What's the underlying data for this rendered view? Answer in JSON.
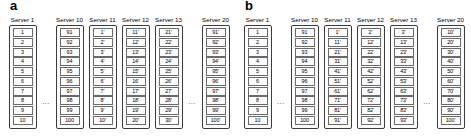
{
  "figure": {
    "panels": [
      {
        "label": "a",
        "columns": [
          {
            "title": "Server 1",
            "cells": [
              "1",
              "2",
              "3",
              "4",
              "5",
              "6",
              "7",
              "8",
              "9",
              "10"
            ]
          },
          {
            "ellipsis": "..."
          },
          {
            "title": "Server 10",
            "cells": [
              "91",
              "92",
              "93",
              "94",
              "95",
              "96",
              "97",
              "98",
              "99",
              "100"
            ]
          },
          {
            "title": "Server 11",
            "cells": [
              "1'",
              "2'",
              "3'",
              "4'",
              "5'",
              "6'",
              "7'",
              "8'",
              "9'",
              "10'"
            ]
          },
          {
            "title": "Server 12",
            "cells": [
              "11'",
              "12'",
              "13'",
              "14'",
              "15'",
              "16'",
              "17'",
              "18'",
              "19'",
              "20'"
            ]
          },
          {
            "title": "Server 13",
            "cells": [
              "21'",
              "22'",
              "23'",
              "24'",
              "25'",
              "26'",
              "27'",
              "28'",
              "29'",
              "30'"
            ]
          },
          {
            "ellipsis": "..."
          },
          {
            "title": "Server 20",
            "cells": [
              "91'",
              "92'",
              "93'",
              "94'",
              "95'",
              "96'",
              "97'",
              "98'",
              "99'",
              "100'"
            ]
          }
        ]
      },
      {
        "label": "b",
        "columns": [
          {
            "title": "Server 1",
            "cells": [
              "1",
              "2",
              "3",
              "4",
              "5",
              "6",
              "7",
              "8",
              "9",
              "10"
            ]
          },
          {
            "ellipsis": "..."
          },
          {
            "title": "Server 10",
            "cells": [
              "91",
              "92",
              "93",
              "94",
              "95",
              "96",
              "97",
              "98",
              "99",
              "100"
            ]
          },
          {
            "title": "Server 11",
            "cells": [
              "1'",
              "11'",
              "21'",
              "31'",
              "41'",
              "51'",
              "61'",
              "71'",
              "81'",
              "91'"
            ]
          },
          {
            "title": "Server 12",
            "cells": [
              "2'",
              "12'",
              "22'",
              "32'",
              "42'",
              "52'",
              "62'",
              "72'",
              "82'",
              "92'"
            ]
          },
          {
            "title": "Server 13",
            "cells": [
              "3'",
              "13'",
              "23'",
              "33'",
              "43'",
              "53'",
              "63'",
              "73'",
              "83'",
              "93'"
            ]
          },
          {
            "ellipsis": "..."
          },
          {
            "title": "Server 20",
            "cells": [
              "10'",
              "20'",
              "30'",
              "40'",
              "50'",
              "60'",
              "70'",
              "80'",
              "90'",
              "100'"
            ]
          }
        ]
      }
    ]
  }
}
